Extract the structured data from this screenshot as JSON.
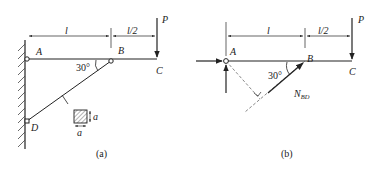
{
  "figure_a": {
    "caption": "(a)",
    "labels": {
      "A": "A",
      "B": "B",
      "C": "C",
      "D": "D",
      "P": "P",
      "len_l": "l",
      "len_half": "l/2",
      "angle": "30°",
      "section_a_side": "a",
      "section_a_bottom": "a"
    }
  },
  "figure_b": {
    "caption": "(b)",
    "labels": {
      "A": "A",
      "B": "B",
      "C": "C",
      "P": "P",
      "len_l": "l",
      "len_half": "l/2",
      "angle": "30°",
      "force_main": "N",
      "force_sub": "BD"
    }
  },
  "colors": {
    "stroke": "#222222",
    "dashed": "#555555",
    "hatch": "#444444"
  }
}
